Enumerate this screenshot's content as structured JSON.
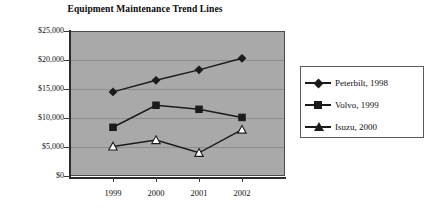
{
  "chart_data": {
    "type": "line",
    "title": "Equipment Maintenance Trend Lines",
    "xlabel": "",
    "ylabel": "",
    "categories": [
      "1999",
      "2000",
      "2001",
      "2002"
    ],
    "ylim": [
      0,
      25000
    ],
    "ytick_step": 5000,
    "ytick_labels": [
      "$25,000",
      "$20,000",
      "$15,000",
      "$10,000",
      "$5,000",
      "$0"
    ],
    "ytick_values": [
      25000,
      20000,
      15000,
      10000,
      5000,
      0
    ],
    "grid": true,
    "legend_position": "right",
    "plot_background": "#a9a9a9",
    "series": [
      {
        "name": "Peterbilt, 1998",
        "marker": "diamond",
        "marker_filled": true,
        "color": "#1b1b1b",
        "values": [
          14500,
          16500,
          18300,
          20300
        ]
      },
      {
        "name": "Volvo, 1999",
        "marker": "square",
        "marker_filled": true,
        "color": "#1b1b1b",
        "values": [
          8400,
          12200,
          11500,
          10100
        ]
      },
      {
        "name": "Isuzu, 2000",
        "marker": "triangle",
        "marker_filled": false,
        "color": "#1b1b1b",
        "values": [
          5100,
          6200,
          4000,
          8000
        ]
      }
    ]
  },
  "legend": {
    "items": [
      {
        "label": "Peterbilt, 1998",
        "symbol": "diamond-marker-icon"
      },
      {
        "label": "Volvo, 1999",
        "symbol": "square-marker-icon"
      },
      {
        "label": "Isuzu, 2000",
        "symbol": "triangle-marker-icon"
      }
    ]
  }
}
